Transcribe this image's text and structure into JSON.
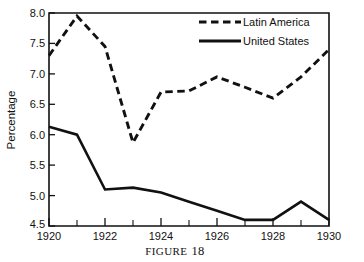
{
  "chart_data": {
    "type": "line",
    "title": "",
    "caption": "FIGURE",
    "caption_number": "18",
    "xlabel": "",
    "ylabel": "Percentage",
    "x": [
      1920,
      1921,
      1922,
      1923,
      1924,
      1925,
      1926,
      1927,
      1928,
      1929,
      1930
    ],
    "xlim": [
      1920,
      1930
    ],
    "ylim": [
      4.5,
      8.0
    ],
    "grid": false,
    "legend_position": "top-right",
    "x_ticks_major": [
      "1920",
      "1922",
      "1924",
      "1926",
      "1928",
      "1930"
    ],
    "x_ticks_major_values": [
      1920,
      1922,
      1924,
      1926,
      1928,
      1930
    ],
    "x_ticks_minor_values": [
      1921,
      1923,
      1925,
      1927,
      1929
    ],
    "y_ticks": [
      "4.5",
      "5.0",
      "5.5",
      "6.0",
      "6.5",
      "7.0",
      "7.5",
      "8.0"
    ],
    "y_tick_values": [
      4.5,
      5.0,
      5.5,
      6.0,
      6.5,
      7.0,
      7.5,
      8.0
    ],
    "series": [
      {
        "name": "Latin America",
        "style": "dashed",
        "color": "#111111",
        "values": [
          7.3,
          7.95,
          7.45,
          5.87,
          6.7,
          6.72,
          6.95,
          6.78,
          6.6,
          6.95,
          7.4
        ]
      },
      {
        "name": "United States",
        "style": "solid",
        "color": "#111111",
        "values": [
          6.13,
          6.0,
          5.1,
          5.13,
          5.05,
          4.9,
          4.75,
          4.6,
          4.6,
          4.9,
          4.6
        ]
      }
    ]
  },
  "legend": {
    "items": [
      {
        "label": "Latin America",
        "style": "dashed"
      },
      {
        "label": "United States",
        "style": "solid"
      }
    ]
  },
  "colors": {
    "ink": "#111111",
    "background": "#ffffff"
  }
}
